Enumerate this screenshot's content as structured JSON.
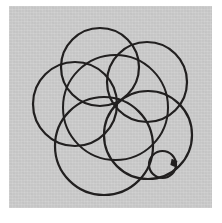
{
  "artwork": {
    "title": "Overlapping Circles Sketch",
    "medium": "ink line drawing on gray paper",
    "paper": {
      "color": "#c9c9c9",
      "margin_color": "#ffffff",
      "left": 9,
      "top": 6,
      "width": 203,
      "height": 202
    },
    "ink_color": "#211f1f",
    "canvas": {
      "width": 222,
      "height": 223
    }
  },
  "chart_data": {
    "type": "scatter",
    "xlabel": "",
    "ylabel": "",
    "xlim": [
      0,
      222
    ],
    "ylim": [
      0,
      223
    ],
    "grid": false,
    "legend": "none",
    "shapes": [
      {
        "name": "central-circle",
        "role": "core",
        "cx": 115.5,
        "cy": 107.5,
        "r": 52.5,
        "stroke_width": 2.0
      },
      {
        "name": "top-petal-circle",
        "role": "petal",
        "cx": 100.0,
        "cy": 67.0,
        "r": 39.0,
        "stroke_width": 2.2
      },
      {
        "name": "upper-right-petal",
        "role": "petal",
        "cx": 147.0,
        "cy": 82.0,
        "r": 40.0,
        "stroke_width": 2.2
      },
      {
        "name": "left-petal-circle",
        "role": "petal",
        "cx": 75.0,
        "cy": 104.0,
        "r": 42.0,
        "stroke_width": 2.2
      },
      {
        "name": "bottom-petal-circle",
        "role": "petal",
        "cx": 104.0,
        "cy": 146.0,
        "r": 49.0,
        "stroke_width": 2.2
      },
      {
        "name": "lower-right-petal",
        "role": "petal",
        "cx": 148.0,
        "cy": 135.0,
        "r": 44.0,
        "stroke_width": 2.2
      },
      {
        "name": "small-circle",
        "role": "satellite",
        "cx": 162.5,
        "cy": 164.5,
        "r": 13.5,
        "stroke_width": 2.2
      }
    ],
    "annotations": [
      {
        "name": "tangent-ink-blob",
        "x": 175.0,
        "y": 163.0,
        "note": "dark ink blot where small circle meets lower-right petal"
      }
    ],
    "counts": {
      "large_circles": 6,
      "small_circles": 1,
      "total_circles": 7
    }
  }
}
